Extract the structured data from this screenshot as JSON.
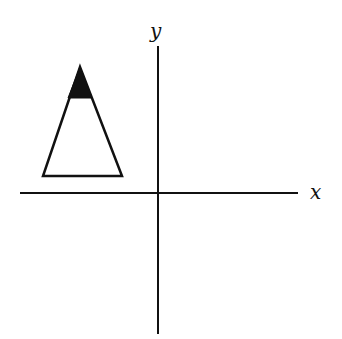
{
  "diagram": {
    "type": "coordinate-plane-with-triangle",
    "axes": {
      "x_label": "x",
      "y_label": "y",
      "origin_px": [
        158,
        193
      ]
    },
    "shape": {
      "kind": "isosceles triangle",
      "quadrant": "II",
      "apex_px": [
        80,
        67
      ],
      "base_left_px": [
        43,
        176
      ],
      "base_right_px": [
        122,
        176
      ],
      "shaded_tip": "apex region filled black",
      "shaded_color": "#000000"
    },
    "colors": {
      "stroke": "#111111",
      "background": "#ffffff"
    }
  }
}
